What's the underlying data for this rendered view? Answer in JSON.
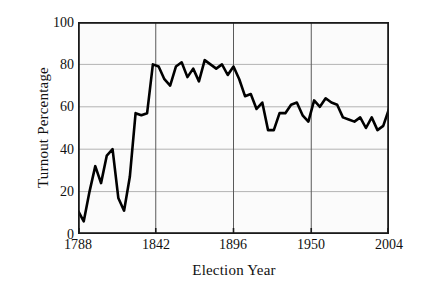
{
  "chart_data": {
    "type": "line",
    "title": "",
    "xlabel": "Election Year",
    "ylabel": "Turnout Percentage",
    "xlim": [
      1788,
      2004
    ],
    "ylim": [
      0,
      100
    ],
    "grid": true,
    "legend": null,
    "xticks": [
      "1788",
      "1842",
      "1896",
      "1950",
      "2004"
    ],
    "xtick_values": [
      1788,
      1842,
      1896,
      1950,
      2004
    ],
    "yticks": [
      "0",
      "20",
      "40",
      "60",
      "80",
      "100"
    ],
    "ytick_values": [
      0,
      20,
      40,
      60,
      80,
      100
    ],
    "line_color": "#000000",
    "grid_color": "#b3b3b3",
    "axis_color": "#1a1a1a",
    "series": [
      {
        "name": "Voter turnout",
        "x": [
          1788,
          1792,
          1796,
          1800,
          1804,
          1808,
          1812,
          1816,
          1820,
          1824,
          1828,
          1832,
          1836,
          1840,
          1844,
          1848,
          1852,
          1856,
          1860,
          1864,
          1868,
          1872,
          1876,
          1880,
          1884,
          1888,
          1892,
          1896,
          1900,
          1904,
          1908,
          1912,
          1916,
          1920,
          1924,
          1928,
          1932,
          1936,
          1940,
          1944,
          1948,
          1952,
          1956,
          1960,
          1964,
          1968,
          1972,
          1976,
          1980,
          1984,
          1988,
          1992,
          1996,
          2000,
          2004
        ],
        "values": [
          11,
          6,
          20,
          32,
          24,
          37,
          40,
          17,
          11,
          27,
          57,
          56,
          57,
          80,
          79,
          73,
          70,
          79,
          81,
          74,
          78,
          72,
          82,
          80,
          78,
          80,
          75,
          79,
          73,
          65,
          66,
          59,
          62,
          49,
          49,
          57,
          57,
          61,
          62,
          56,
          53,
          63,
          60,
          64,
          62,
          61,
          55,
          54,
          53,
          55,
          50,
          55,
          49,
          51,
          59
        ]
      }
    ]
  },
  "figure": {
    "xlabel": "Election Year",
    "ylabel": "Turnout Percentage"
  }
}
